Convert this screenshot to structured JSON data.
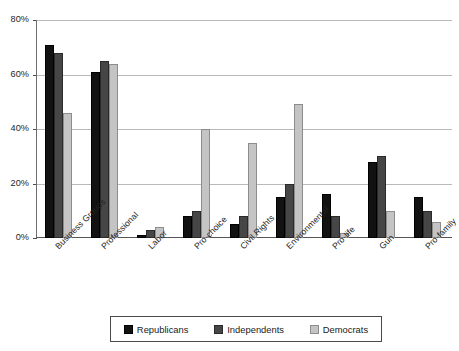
{
  "chart_data": {
    "type": "bar",
    "title": "",
    "xlabel": "",
    "ylabel": "",
    "ylim": [
      0,
      80
    ],
    "yticks": [
      "0%",
      "20%",
      "40%",
      "60%",
      "80%"
    ],
    "ytick_values": [
      0,
      20,
      40,
      60,
      80
    ],
    "grid": true,
    "legend_position": "bottom",
    "categories": [
      "Business Groups",
      "Professional",
      "Labor",
      "Pro-choice",
      "Civil Rights",
      "Environmental",
      "Pro-life",
      "Gun",
      "Pro-family"
    ],
    "series": [
      {
        "name": "Republicans",
        "color": "#121212",
        "values": [
          71,
          61,
          1,
          8,
          5,
          15,
          16,
          28,
          15
        ]
      },
      {
        "name": "Independents",
        "color": "#464646",
        "values": [
          68,
          65,
          3,
          10,
          8,
          20,
          8,
          30,
          10
        ]
      },
      {
        "name": "Democrats",
        "color": "#c4c4c4",
        "values": [
          46,
          64,
          4,
          40,
          35,
          49,
          2,
          10,
          6
        ]
      }
    ]
  },
  "legend": {
    "items": [
      {
        "label": "Republicans",
        "swatch": "rep"
      },
      {
        "label": "Independents",
        "swatch": "ind"
      },
      {
        "label": "Democrats",
        "swatch": "dem"
      }
    ]
  }
}
